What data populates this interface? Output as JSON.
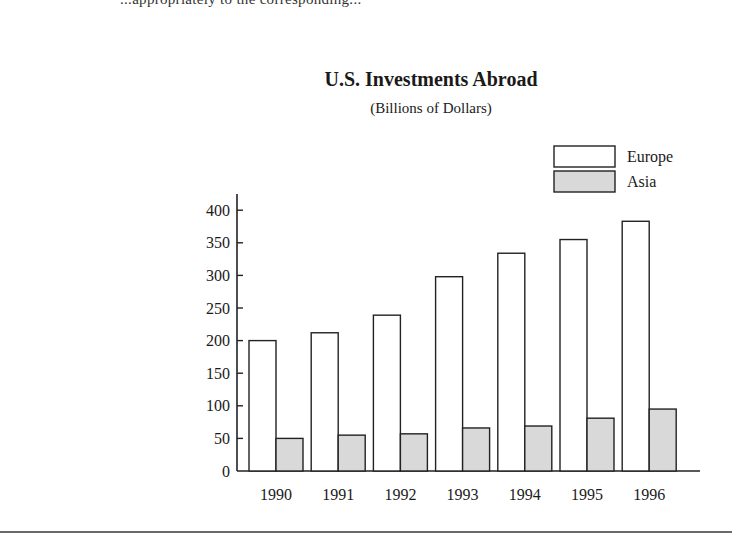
{
  "page": {
    "cut_off_text": "...appropriately to the corresponding..."
  },
  "chart_data": {
    "type": "bar",
    "title": "U.S. Investments Abroad",
    "subtitle": "(Billions of Dollars)",
    "xlabel": "",
    "ylabel": "",
    "categories": [
      "1990",
      "1991",
      "1992",
      "1993",
      "1994",
      "1995",
      "1996"
    ],
    "series": [
      {
        "name": "Europe",
        "color": "#ffffff",
        "values": [
          200,
          212,
          239,
          298,
          334,
          355,
          383
        ]
      },
      {
        "name": "Asia",
        "color": "#d9d9d9",
        "values": [
          50,
          55,
          57,
          66,
          69,
          81,
          95
        ]
      }
    ],
    "yticks": [
      0,
      50,
      100,
      150,
      200,
      250,
      300,
      350,
      400
    ],
    "ylim": [
      0,
      420
    ],
    "grid": false,
    "legend_position": "top-right"
  }
}
